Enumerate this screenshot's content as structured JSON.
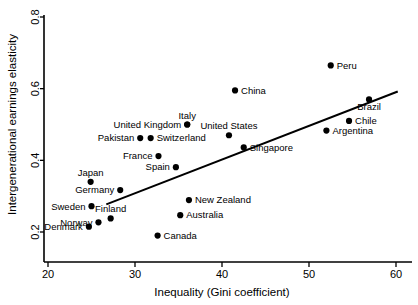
{
  "chart_data": {
    "type": "scatter",
    "title": "",
    "xlabel": "Inequality (Gini coefficient)",
    "ylabel": "Intergenerational earnings elasticity",
    "xlim": [
      20,
      60
    ],
    "ylim": [
      0.2,
      0.8
    ],
    "xticks": [
      20,
      30,
      40,
      50,
      60
    ],
    "xtick_labels": [
      "20",
      "30",
      "40",
      "50",
      "60"
    ],
    "yticks": [
      0.2,
      0.4,
      0.6,
      0.8
    ],
    "ytick_labels": [
      "0.2",
      "0.4",
      "0.6",
      "0.8"
    ],
    "grid": false,
    "legend": "none",
    "marker_color": "#000000",
    "line_color": "#000000",
    "trend_line": {
      "label": "fitted regression line",
      "x_start": 26.7,
      "y_start": 0.277,
      "x_end": 60.2,
      "y_end": 0.592
    },
    "points": [
      {
        "label": "Denmark",
        "x": 24.7,
        "y": 0.215,
        "label_pos": "left"
      },
      {
        "label": "Norway",
        "x": 25.8,
        "y": 0.227,
        "label_pos": "left"
      },
      {
        "label": "Finland",
        "x": 27.2,
        "y": 0.238,
        "label_pos": "above"
      },
      {
        "label": "Sweden",
        "x": 25.0,
        "y": 0.272,
        "label_pos": "left"
      },
      {
        "label": "Germany",
        "x": 28.3,
        "y": 0.317,
        "label_pos": "left"
      },
      {
        "label": "Japan",
        "x": 24.9,
        "y": 0.34,
        "label_pos": "above"
      },
      {
        "label": "Canada",
        "x": 32.6,
        "y": 0.19,
        "label_pos": "right"
      },
      {
        "label": "Australia",
        "x": 35.2,
        "y": 0.247,
        "label_pos": "right"
      },
      {
        "label": "New Zealand",
        "x": 36.2,
        "y": 0.289,
        "label_pos": "right"
      },
      {
        "label": "Spain",
        "x": 34.7,
        "y": 0.381,
        "label_pos": "left"
      },
      {
        "label": "France",
        "x": 32.7,
        "y": 0.412,
        "label_pos": "left"
      },
      {
        "label": "Pakistan",
        "x": 30.6,
        "y": 0.462,
        "label_pos": "left"
      },
      {
        "label": "Switzerland",
        "x": 31.8,
        "y": 0.462,
        "label_pos": "right"
      },
      {
        "label": "United Kingdom",
        "x": 36.0,
        "y": 0.5,
        "label_pos": "left"
      },
      {
        "label": "Italy",
        "x": 36.0,
        "y": 0.5,
        "label_pos": "above"
      },
      {
        "label": "United States",
        "x": 40.8,
        "y": 0.47,
        "label_pos": "above"
      },
      {
        "label": "Singapore",
        "x": 42.5,
        "y": 0.436,
        "label_pos": "right"
      },
      {
        "label": "China",
        "x": 41.5,
        "y": 0.595,
        "label_pos": "right"
      },
      {
        "label": "Peru",
        "x": 52.5,
        "y": 0.665,
        "label_pos": "right"
      },
      {
        "label": "Brazil",
        "x": 56.9,
        "y": 0.57,
        "label_pos": "below"
      },
      {
        "label": "Chile",
        "x": 54.6,
        "y": 0.51,
        "label_pos": "right"
      },
      {
        "label": "Argentina",
        "x": 52.0,
        "y": 0.483,
        "label_pos": "right"
      }
    ]
  }
}
